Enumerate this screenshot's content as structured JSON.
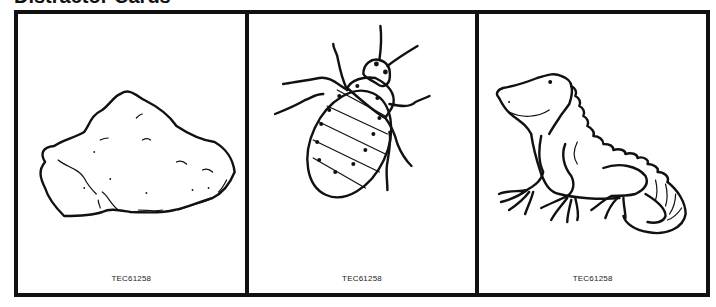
{
  "page": {
    "title": "Distractor Cards"
  },
  "cards": [
    {
      "image": "rock-icon",
      "label": "Rock",
      "code": "TEC61258"
    },
    {
      "image": "bug-icon",
      "label": "Bedbug",
      "code": "TEC61258"
    },
    {
      "image": "iguana-icon",
      "label": "Iguana",
      "code": "TEC61258"
    }
  ],
  "colors": {
    "line": "#111111",
    "background": "#ffffff"
  }
}
